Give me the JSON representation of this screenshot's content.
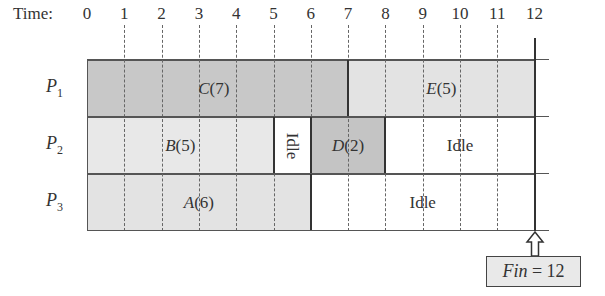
{
  "diagram": {
    "type": "gantt_schedule",
    "time_axis": {
      "label": "Time:",
      "ticks": [
        "0",
        "1",
        "2",
        "3",
        "4",
        "5",
        "6",
        "7",
        "8",
        "9",
        "10",
        "11",
        "12"
      ]
    },
    "processors": [
      {
        "name": "P",
        "sub": "1"
      },
      {
        "name": "P",
        "sub": "2"
      },
      {
        "name": "P",
        "sub": "3"
      }
    ],
    "tasks": [
      {
        "row": 0,
        "start": 0,
        "end": 7,
        "name": "C",
        "duration": "(7)",
        "fill": "#c8c8c8",
        "label_x": 3.4
      },
      {
        "row": 0,
        "start": 7,
        "end": 12,
        "name": "E",
        "duration": "(5)",
        "fill": "#e3e3e3",
        "label_x": 9.5
      },
      {
        "row": 1,
        "start": 0,
        "end": 5,
        "name": "B",
        "duration": "(5)",
        "fill": "#e8e8e8",
        "label_x": 2.5
      },
      {
        "row": 1,
        "start": 5,
        "end": 6,
        "name": "Idle",
        "duration": "",
        "fill": "#ffffff",
        "label_x": 5.5,
        "vertical": true
      },
      {
        "row": 1,
        "start": 6,
        "end": 8,
        "name": "D",
        "duration": "(2)",
        "fill": "#c4c4c4",
        "label_x": 7.0
      },
      {
        "row": 1,
        "start": 8,
        "end": 12,
        "name": "Idle",
        "duration": "",
        "fill": "#ffffff",
        "label_x": 10.0
      },
      {
        "row": 2,
        "start": 0,
        "end": 6,
        "name": "A",
        "duration": "(6)",
        "fill": "#e3e3e3",
        "label_x": 3.0
      },
      {
        "row": 2,
        "start": 6,
        "end": 12,
        "name": "Idle",
        "duration": "",
        "fill": "#ffffff",
        "label_x": 9.0
      }
    ],
    "finish": {
      "label_var": "Fin",
      "label_eq": " = 12",
      "time": 12
    }
  },
  "colors": {
    "line": "#555555",
    "text": "#333333"
  }
}
